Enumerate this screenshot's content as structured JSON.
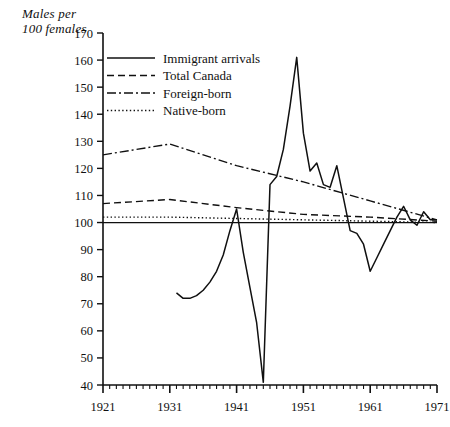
{
  "axis_caption": "Males per\n100 females",
  "legend": {
    "items": [
      {
        "label": "Immigrant arrivals",
        "style": "solid",
        "key": "immigrant_arrivals"
      },
      {
        "label": "Total Canada",
        "style": "dashed",
        "key": "total_canada"
      },
      {
        "label": "Foreign-born",
        "style": "dashdot",
        "key": "foreign_born"
      },
      {
        "label": "Native-born",
        "style": "dotted",
        "key": "native_born"
      }
    ]
  },
  "chart_data": {
    "type": "line",
    "title": "",
    "xlabel": "",
    "ylabel": "Males per 100 females",
    "xlim": [
      1921,
      1971
    ],
    "ylim": [
      40,
      170
    ],
    "ytick_labels": [
      40,
      50,
      60,
      70,
      80,
      90,
      100,
      110,
      120,
      130,
      140,
      150,
      160,
      170
    ],
    "xtick_labels": [
      1921,
      1931,
      1941,
      1951,
      1961,
      1971
    ],
    "xminor_step": 1,
    "grid": false,
    "legend_position": "top-left-inside",
    "reference_line": {
      "y": 100,
      "style": "solid"
    },
    "series": [
      {
        "name": "Immigrant arrivals",
        "style": "solid",
        "x": [
          1932,
          1933,
          1934,
          1935,
          1936,
          1937,
          1938,
          1939,
          1940,
          1941,
          1942,
          1943,
          1944,
          1945,
          1946,
          1947,
          1948,
          1949,
          1950,
          1951,
          1952,
          1953,
          1954,
          1955,
          1956,
          1957,
          1958,
          1959,
          1960,
          1961,
          1962,
          1963,
          1964,
          1965,
          1966,
          1967,
          1968,
          1969,
          1970,
          1971
        ],
        "values": [
          74,
          72,
          72,
          73,
          75,
          78,
          82,
          88,
          97,
          105,
          89,
          76,
          63,
          41,
          114,
          117,
          127,
          143,
          161,
          133,
          119,
          122,
          114,
          113,
          121,
          109,
          97,
          96,
          92,
          82,
          87,
          92,
          97,
          102,
          106,
          101,
          99,
          104,
          101,
          101
        ]
      },
      {
        "name": "Total Canada",
        "style": "dashed",
        "x": [
          1921,
          1931,
          1941,
          1951,
          1961,
          1971
        ],
        "values": [
          107,
          108.5,
          105.5,
          103,
          102,
          100.5
        ]
      },
      {
        "name": "Foreign-born",
        "style": "dashdot",
        "x": [
          1921,
          1931,
          1941,
          1951,
          1961,
          1971
        ],
        "values": [
          125,
          129,
          121,
          115,
          108,
          101
        ]
      },
      {
        "name": "Native-born",
        "style": "dotted",
        "x": [
          1921,
          1931,
          1941,
          1951,
          1961,
          1971
        ],
        "values": [
          102,
          102,
          101.5,
          101,
          100.5,
          100
        ]
      }
    ]
  }
}
